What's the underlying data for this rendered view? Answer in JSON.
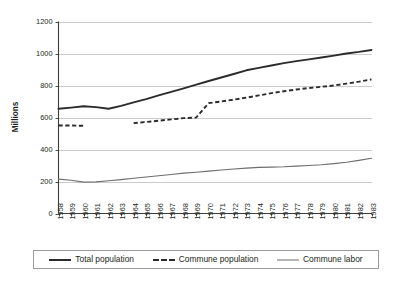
{
  "chart_data": {
    "type": "line",
    "title": "",
    "xlabel": "",
    "ylabel": "Millions",
    "ylim": [
      0,
      1200
    ],
    "ytick_step": 200,
    "yticks": [
      "0",
      "200",
      "400",
      "600",
      "800",
      "1000",
      "1200"
    ],
    "grid": true,
    "legend_position": "bottom",
    "categories": [
      "1958",
      "1959",
      "1960",
      "1961",
      "1962",
      "1963",
      "1964",
      "1965",
      "1966",
      "1967",
      "1968",
      "1969",
      "1970",
      "1971",
      "1972",
      "1973",
      "1974",
      "1975",
      "1976",
      "1977",
      "1978",
      "1979",
      "1980",
      "1981",
      "1982",
      "1983"
    ],
    "series": [
      {
        "name": "Total population",
        "style": "solid-thick",
        "color": "#2b2b2b",
        "values": [
          655,
          662,
          670,
          665,
          655,
          673,
          695,
          715,
          738,
          760,
          782,
          805,
          828,
          850,
          872,
          895,
          910,
          925,
          940,
          952,
          963,
          975,
          987,
          1000,
          1010,
          1022
        ]
      },
      {
        "name": "Commune population",
        "style": "dashed",
        "color": "#2b2b2b",
        "values": [
          550,
          550,
          548,
          null,
          null,
          null,
          565,
          572,
          580,
          588,
          596,
          600,
          690,
          700,
          712,
          724,
          738,
          752,
          764,
          775,
          784,
          792,
          800,
          812,
          824,
          838
        ]
      },
      {
        "name": "Commune labor",
        "style": "solid-thin",
        "color": "#6e6e6e",
        "values": [
          215,
          208,
          196,
          198,
          205,
          212,
          220,
          228,
          236,
          244,
          252,
          258,
          265,
          272,
          278,
          284,
          288,
          290,
          292,
          296,
          300,
          305,
          312,
          320,
          332,
          345
        ]
      }
    ]
  },
  "legend": {
    "entries": [
      {
        "label": "Total population",
        "style": "solid-thick"
      },
      {
        "label": "Commune population",
        "style": "dashed"
      },
      {
        "label": "Commune labor",
        "style": "solid-thin"
      }
    ]
  },
  "colors": {
    "line_dark": "#2b2b2b",
    "line_gray": "#6e6e6e",
    "gridline": "#b5b5b5",
    "axis": "#3b3b3b",
    "text": "#231f20",
    "background": "#ffffff"
  }
}
